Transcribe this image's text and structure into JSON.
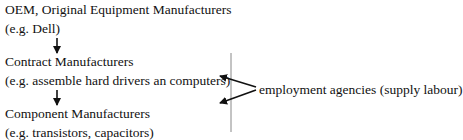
{
  "diagram": {
    "nodes": [
      {
        "id": "oem",
        "title": "OEM, Original Equipment Manufacturers",
        "example": "(e.g. Dell)"
      },
      {
        "id": "contract",
        "title": "Contract Manufacturers",
        "example": "(e.g. assemble hard drivers an computers)"
      },
      {
        "id": "component",
        "title": "Component Manufacturers",
        "example": "(e.g. transistors, capacitors)"
      }
    ],
    "side_label": "employment agencies (supply labour)",
    "edges": [
      {
        "from": "oem",
        "to": "contract"
      },
      {
        "from": "contract",
        "to": "component"
      },
      {
        "from": "side_label",
        "to": "contract"
      },
      {
        "from": "side_label",
        "to": "component"
      }
    ]
  }
}
